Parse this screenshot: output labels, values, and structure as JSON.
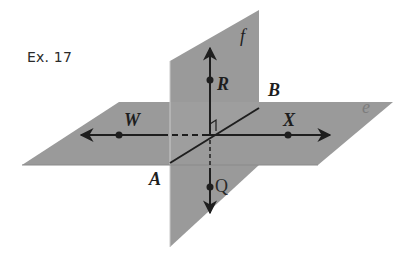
{
  "exercise_label": "Ex. 17",
  "planes": {
    "horizontal": {
      "name": "e",
      "color": "#9a9a9a",
      "label_color": "#808080"
    },
    "vertical": {
      "name": "f",
      "color": "#9a9a9a",
      "label_color": "#1e1e1e"
    }
  },
  "points": {
    "A": "A",
    "B": "B",
    "W": "W",
    "X": "X",
    "R": "R",
    "Q": "Q"
  },
  "colors": {
    "line": "#1e1e1e",
    "plane": "#9a9a9a",
    "background": "#ffffff"
  }
}
